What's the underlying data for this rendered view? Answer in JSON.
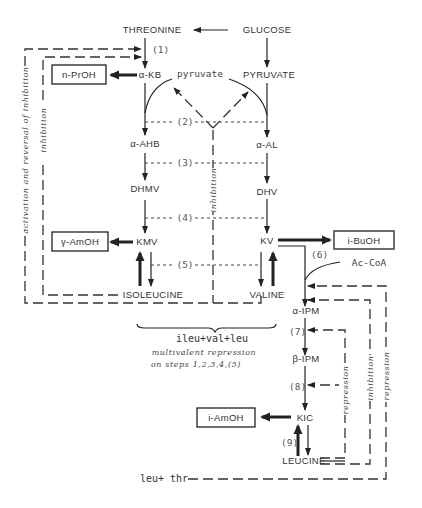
{
  "nodes": {
    "threonine": "THREONINE",
    "glucose": "GLUCOSE",
    "akb": "α-KB",
    "pyruvate_lower": "pyruvate",
    "pyruvate_upper": "PYRUVATE",
    "aahb": "α-AHB",
    "aal": "α-AL",
    "dhmv": "DHMV",
    "dhv": "DHV",
    "kmv": "KMV",
    "kv": "KV",
    "isoleucine": "ISOLEUCINE",
    "valine": "VALINE",
    "aipm": "α-IPM",
    "bipm": "β-IPM",
    "kic": "KIC",
    "leucine": "LEUCINE",
    "accoa": "Ac-CoA"
  },
  "products": {
    "nproh": "n-PrOH",
    "amoh_kmv": "γ-AmOH",
    "buoh": "i-BuOH",
    "amoh_kic": "i-AmOH"
  },
  "steps": [
    "(1)",
    "(2)",
    "(3)",
    "(4)",
    "(5)",
    "(6)",
    "(7)",
    "(8)",
    "(9)"
  ],
  "regulation": {
    "left_outer": "activation and reversal of inhibition",
    "left_inner": "inhibition",
    "center": "inhibition",
    "right_inner": "repression",
    "right_middle": "inhibition",
    "right_outer": "repression"
  },
  "multivalent": {
    "effectors": "ileu+val+leu",
    "line1": "multivalent repression",
    "line2": "on steps 1,2,3,4,(5)"
  },
  "leu_thr": "leu+ thr"
}
